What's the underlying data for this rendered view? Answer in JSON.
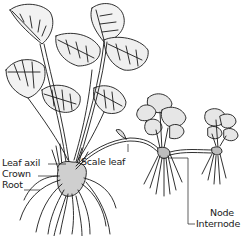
{
  "diagram": {
    "colors": {
      "ink": "#1a1a1a",
      "background": "#ffffff"
    },
    "labels": {
      "leaf_axil": "Leaf axil",
      "crown": "Crown",
      "root": "Root",
      "scale_leaf": "Scale leaf",
      "node": "Node",
      "internode": "Internode"
    }
  }
}
